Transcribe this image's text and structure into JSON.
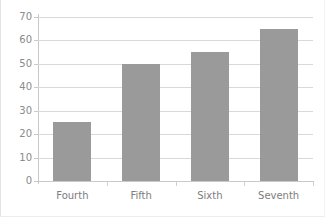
{
  "figure": {
    "cropped_title": "",
    "background_color": "#ffffff"
  },
  "chart_data": {
    "type": "bar",
    "title": "",
    "xlabel": "",
    "ylabel": "",
    "categories": [
      "Fourth",
      "Fifth",
      "Sixth",
      "Seventh"
    ],
    "values": [
      25,
      50,
      55,
      65
    ],
    "series": [
      {
        "name": "",
        "values": [
          25,
          50,
          55,
          65
        ],
        "color": "#9a9a9a"
      }
    ],
    "ylim": [
      0,
      70
    ],
    "y_ticks": [
      0,
      10,
      20,
      30,
      40,
      50,
      60,
      70
    ],
    "y_tick_labels": [
      "0",
      "10",
      "20",
      "30",
      "40",
      "50",
      "60",
      "70"
    ],
    "grid": true,
    "grid_axis": "y",
    "grid_color": "#d9d9d9",
    "legend": false,
    "legend_position": "none",
    "bar_color": "#9a9a9a",
    "axis_color": "#c9c9c9",
    "tick_label_color": "#8a8a8a",
    "category_label_color": "#7d7d7d"
  }
}
